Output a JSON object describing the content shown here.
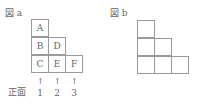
{
  "figure_a": {
    "title": "図 a",
    "cells": [
      {
        "label": "A",
        "col": 0,
        "row": 0
      },
      {
        "label": "B",
        "col": 0,
        "row": 1
      },
      {
        "label": "D",
        "col": 1,
        "row": 1
      },
      {
        "label": "C",
        "col": 0,
        "row": 2
      },
      {
        "label": "E",
        "col": 1,
        "row": 2
      },
      {
        "label": "F",
        "col": 2,
        "row": 2
      }
    ],
    "front_label": "正面",
    "arrow_glyph": "↑",
    "column_numbers": [
      "1",
      "2",
      "3"
    ]
  },
  "figure_b": {
    "title": "図 b",
    "cells": [
      {
        "col": 0,
        "row": 0
      },
      {
        "col": 0,
        "row": 1
      },
      {
        "col": 1,
        "row": 1
      },
      {
        "col": 0,
        "row": 2
      },
      {
        "col": 1,
        "row": 2
      },
      {
        "col": 2,
        "row": 2
      }
    ]
  }
}
